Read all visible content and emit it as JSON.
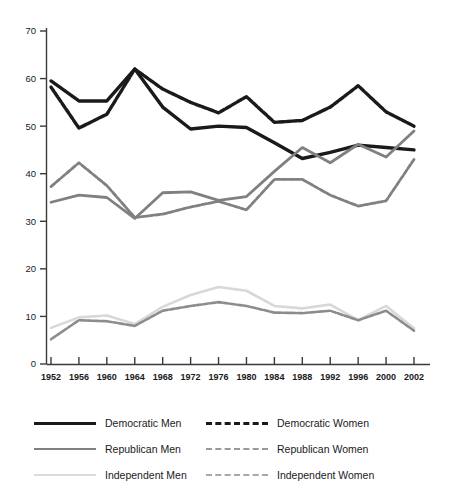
{
  "chart_data": {
    "type": "line",
    "title": "",
    "xlabel": "",
    "ylabel": "",
    "xlim": [
      1952,
      2002
    ],
    "ylim": [
      0,
      70
    ],
    "yticks": [
      0,
      10,
      20,
      30,
      40,
      50,
      60,
      70
    ],
    "grid": false,
    "legend_position": "bottom",
    "categories": [
      "1952",
      "1956",
      "1960",
      "1964",
      "1968",
      "1972",
      "1976",
      "1980",
      "1984",
      "1988",
      "1992",
      "1996",
      "2000",
      "2002"
    ],
    "series": [
      {
        "name": "Democratic Men",
        "style": "solid",
        "color": "#1a1a1a",
        "values": [
          59.5,
          55.3,
          55.3,
          62.0,
          54.0,
          49.4,
          50.0,
          49.7,
          46.5,
          43.2,
          44.5,
          46.0,
          45.5,
          45.0
        ]
      },
      {
        "name": "Democratic Women",
        "style": "dashed",
        "color": "#1a1a1a",
        "values": [
          58.2,
          49.6,
          52.5,
          62.0,
          57.8,
          55.0,
          52.8,
          56.2,
          50.8,
          51.2,
          54.0,
          58.5,
          53.0,
          50.0
        ]
      },
      {
        "name": "Republican Men",
        "style": "solid",
        "color": "#808080",
        "values": [
          34.0,
          35.5,
          35.0,
          30.6,
          36.0,
          36.2,
          34.4,
          35.2,
          40.5,
          45.5,
          42.3,
          46.2,
          43.5,
          49.0
        ]
      },
      {
        "name": "Republican Women",
        "style": "dashed",
        "color": "#808080",
        "values": [
          37.3,
          42.3,
          37.5,
          30.8,
          31.5,
          33.0,
          34.2,
          32.4,
          38.8,
          38.8,
          35.5,
          33.2,
          34.3,
          43.0
        ]
      },
      {
        "name": "Independent Men",
        "style": "solid",
        "color": "#d8d8d8",
        "values": [
          7.6,
          9.8,
          10.2,
          8.4,
          12.0,
          14.5,
          16.2,
          15.4,
          12.2,
          11.7,
          12.5,
          9.2,
          12.2,
          7.5
        ]
      },
      {
        "name": "Independent Women",
        "style": "dashed",
        "color": "#8c8c8c",
        "values": [
          5.2,
          9.2,
          9.0,
          8.0,
          11.2,
          12.2,
          13.0,
          12.2,
          10.8,
          10.7,
          11.2,
          9.2,
          11.2,
          7.0
        ]
      }
    ]
  },
  "legend": {
    "entries": [
      {
        "label": "Democratic Men",
        "color": "#1a1a1a",
        "style": "solid",
        "width": 3.2
      },
      {
        "label": "Democratic Women",
        "color": "#1a1a1a",
        "style": "dashed",
        "width": 3.2
      },
      {
        "label": "Republican Men",
        "color": "#808080",
        "style": "solid",
        "width": 2.6
      },
      {
        "label": "Republican Women",
        "color": "#9a9a9a",
        "style": "dashed",
        "width": 2.6
      },
      {
        "label": "Independent Men",
        "color": "#dcdcdc",
        "style": "solid",
        "width": 2.4
      },
      {
        "label": "Independent Women",
        "color": "#a8a8a8",
        "style": "dashed",
        "width": 2.4
      }
    ]
  }
}
